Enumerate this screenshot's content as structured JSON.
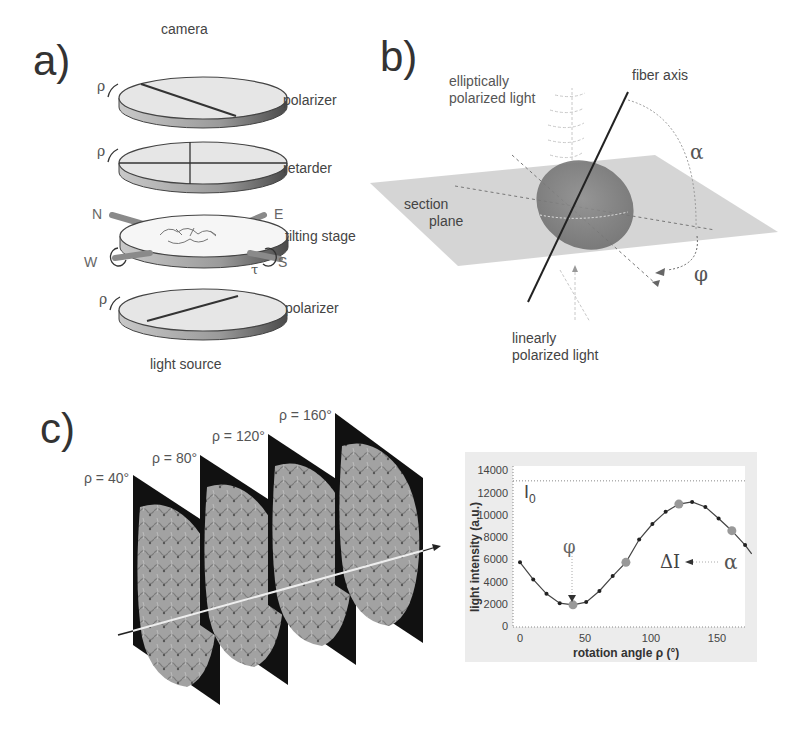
{
  "panel_a": {
    "label": "a)",
    "camera": "camera",
    "polarizer_top": "polarizer",
    "retarder": "retarder",
    "tilting_stage": "tilting stage",
    "polarizer_bottom": "polarizer",
    "light_source": "light source",
    "rho_symbol": "ρ",
    "tau_symbol": "τ",
    "compass": {
      "N": "N",
      "E": "E",
      "W": "W",
      "S": "S"
    }
  },
  "panel_b": {
    "label": "b)",
    "elliptic_line1": "elliptically",
    "elliptic_line2": "polarized light",
    "fiber_axis": "fiber axis",
    "section_line1": "section",
    "section_line2": "plane",
    "linear_line1": "linearly",
    "linear_line2": "polarized light",
    "alpha": "α",
    "phi": "φ"
  },
  "panel_c": {
    "label": "c)",
    "slices": [
      {
        "label": "ρ = 40°"
      },
      {
        "label": "ρ = 80°"
      },
      {
        "label": "ρ = 120°"
      },
      {
        "label": "ρ = 160°"
      }
    ]
  },
  "chart_data": {
    "type": "line",
    "title": "",
    "xlabel": "rotation angle ρ (°)",
    "ylabel": "light intensity (a.u.)",
    "xlim": [
      0,
      175
    ],
    "ylim": [
      0,
      14000
    ],
    "xticks": [
      "0",
      "50",
      "100",
      "150"
    ],
    "yticks": [
      "0",
      "2000",
      "4000",
      "6000",
      "8000",
      "10000",
      "12000",
      "14000"
    ],
    "grid": false,
    "series": [
      {
        "name": "measured intensity",
        "x": [
          0,
          10,
          20,
          30,
          40,
          50,
          60,
          70,
          80,
          90,
          100,
          110,
          120,
          130,
          140,
          150,
          160,
          170
        ],
        "values": [
          5840,
          4300,
          3000,
          2150,
          2000,
          2250,
          3250,
          4600,
          5840,
          7900,
          9300,
          10400,
          11100,
          11300,
          10850,
          9800,
          8700,
          7400
        ]
      }
    ],
    "highlighted_points": [
      {
        "x": 40,
        "y": 2000
      },
      {
        "x": 80,
        "y": 5840
      },
      {
        "x": 120,
        "y": 11100
      },
      {
        "x": 160,
        "y": 8700
      }
    ],
    "reference_line": {
      "label": "I0",
      "y": 13200
    },
    "annotations": [
      {
        "text": "I0",
        "position": "top-left"
      },
      {
        "text": "φ",
        "points_to": "minimum at ρ≈40°"
      },
      {
        "text": "ΔI",
        "position": "right"
      },
      {
        "text": "α",
        "arrow_to": "ΔI"
      }
    ]
  },
  "chart_text": {
    "I0_main": "I",
    "I0_sub": "0",
    "phi": "φ",
    "deltaI": "ΔI",
    "alpha": "α"
  }
}
